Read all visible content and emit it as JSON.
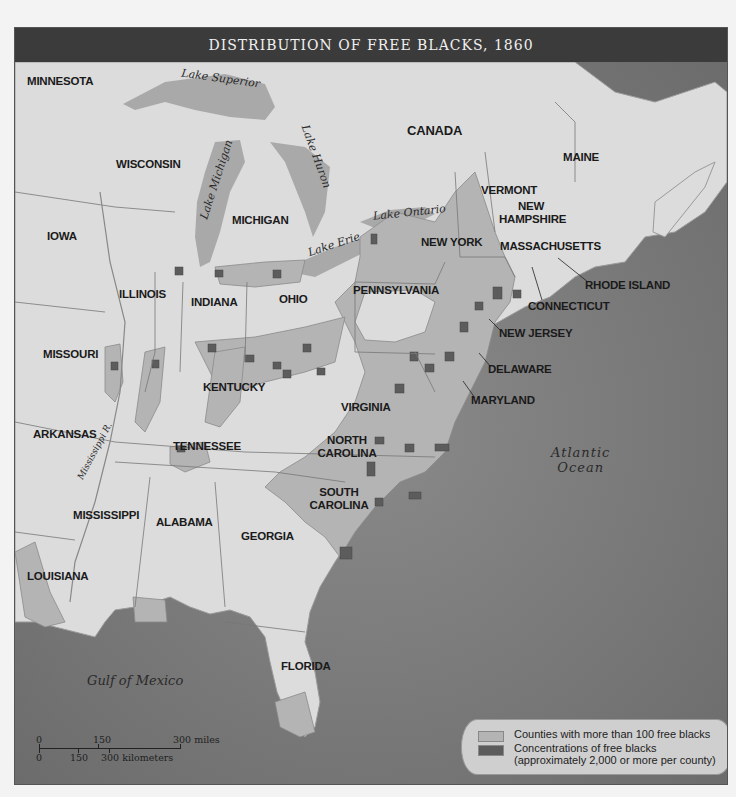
{
  "title": "DISTRIBUTION OF FREE BLACKS, 1860",
  "colors": {
    "title_bar": "#3b3b3b",
    "land": "#dcdcdc",
    "water": "#7a7a7a",
    "lakes": "#a9a9a9",
    "counties_over_100": "#b4b4b4",
    "concentrations": "#5c5c5c"
  },
  "states": [
    {
      "name": "MINNESOTA"
    },
    {
      "name": "WISCONSIN"
    },
    {
      "name": "MICHIGAN"
    },
    {
      "name": "IOWA"
    },
    {
      "name": "ILLINOIS"
    },
    {
      "name": "INDIANA"
    },
    {
      "name": "OHIO"
    },
    {
      "name": "MISSOURI"
    },
    {
      "name": "KENTUCKY"
    },
    {
      "name": "ARKANSAS"
    },
    {
      "name": "TENNESSEE"
    },
    {
      "name": "MISSISSIPPI"
    },
    {
      "name": "ALABAMA"
    },
    {
      "name": "GEORGIA"
    },
    {
      "name": "LOUISIANA"
    },
    {
      "name": "FLORIDA"
    },
    {
      "name": "SOUTH CAROLINA"
    },
    {
      "name": "NORTH CAROLINA"
    },
    {
      "name": "VIRGINIA"
    },
    {
      "name": "PENNSYLVANIA"
    },
    {
      "name": "NEW YORK"
    },
    {
      "name": "VERMONT"
    },
    {
      "name": "NEW HAMPSHIRE"
    },
    {
      "name": "MAINE"
    },
    {
      "name": "MASSACHUSETTS"
    },
    {
      "name": "RHODE ISLAND"
    },
    {
      "name": "CONNECTICUT"
    },
    {
      "name": "NEW JERSEY"
    },
    {
      "name": "DELAWARE"
    },
    {
      "name": "MARYLAND"
    }
  ],
  "regions": {
    "canada": "CANADA"
  },
  "water_labels": {
    "lake_superior": "Lake Superior",
    "lake_michigan": "Lake Michigan",
    "lake_huron": "Lake Huron",
    "lake_erie": "Lake Erie",
    "lake_ontario": "Lake Ontario",
    "mississippi": "Mississippi R.",
    "atlantic_1": "Atlantic",
    "atlantic_2": "Ocean",
    "gulf": "Gulf of Mexico"
  },
  "legend": {
    "items": [
      {
        "label": "Counties with more than 100 free blacks"
      },
      {
        "label": "Concentrations of free blacks",
        "sublabel": "(approximately 2,000 or more per county)"
      }
    ]
  },
  "scale": {
    "miles": [
      "0",
      "150",
      "300 miles"
    ],
    "km": [
      "0",
      "150",
      "300 kilometers"
    ]
  }
}
